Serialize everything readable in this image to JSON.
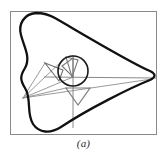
{
  "figure": {
    "caption": "(a)",
    "background_color": "#ffffff",
    "frame": {
      "stroke_color": "#8a8a8a",
      "stroke_width": 1,
      "x": 10.5,
      "y": 11.5,
      "width": 146,
      "height": 123
    },
    "coupler_curve": {
      "name": "coupler-curve",
      "description": "closed rounded triangular coupler curve with concave notch on the left side",
      "stroke_color": "#111111",
      "stroke_width": 2.3,
      "fill": "none",
      "path": "M 36 13 C 24 14 18 24 21 35 C 24 47 31 57 25 68 C 20 76 20 80 25 88 C 32 99 26 113 33 124 C 39 133 50 134 61 127 C 88 109 132 87 150 80 C 156 77 156 74 150 71 C 129 62 76 30 55 18 C 48 14 42 13 36 13 Z"
    },
    "mechanism": {
      "name": "four-bar-linkage",
      "pivot_ground": {
        "x": 23,
        "y": 98
      },
      "circle": {
        "name": "crank-circle",
        "cx": 73,
        "cy": 71,
        "r": 15,
        "stroke_color": "#1a1a1a",
        "stroke_width": 1.6,
        "fill": "none"
      },
      "joint_center": {
        "x": 73,
        "y": 77
      },
      "left_triangle": {
        "name": "left-coupler-triangle",
        "points": "45,63 63,70 59,81",
        "stroke_color": "#6e6e6e",
        "stroke_width": 1.1
      },
      "upper_triangle": {
        "name": "upper-coupler-triangle",
        "points": "66,57 78,60 72,77",
        "stroke_color": "#7a7a7a",
        "stroke_width": 1.1
      },
      "inner_triangle": {
        "name": "inner-coupler-triangle",
        "points": "62,66 73,58 73,77",
        "stroke_color": "#7a7a7a",
        "stroke_width": 1.1
      },
      "lower_triangle": {
        "name": "lower-follower-triangle",
        "points": "66,88 90,88 78,105",
        "stroke_color": "#7d7d7d",
        "stroke_width": 1.2
      },
      "vertical_link": {
        "name": "vertical-link",
        "x1": 73,
        "y1": 55,
        "x2": 73,
        "y2": 128,
        "stroke_color": "#8a8a8a",
        "stroke_width": 1.0
      },
      "horizontal_link": {
        "name": "horizontal-link",
        "x1": 44,
        "y1": 77,
        "x2": 156,
        "y2": 78,
        "stroke_color": "#8a8a8a",
        "stroke_width": 1.0
      },
      "construction_lines": [
        {
          "name": "construction-line-to-circle-top",
          "x1": 23,
          "y1": 98,
          "x2": 66,
          "y2": 57
        },
        {
          "name": "construction-line-to-joint",
          "x1": 23,
          "y1": 98,
          "x2": 73,
          "y2": 77
        },
        {
          "name": "construction-line-to-left-triangle",
          "x1": 23,
          "y1": 98,
          "x2": 45,
          "y2": 63
        },
        {
          "name": "construction-line-to-right-tip",
          "x1": 23,
          "y1": 98,
          "x2": 152,
          "y2": 79
        },
        {
          "name": "construction-line-to-lower-triangle",
          "x1": 23,
          "y1": 98,
          "x2": 66,
          "y2": 88
        }
      ]
    }
  }
}
